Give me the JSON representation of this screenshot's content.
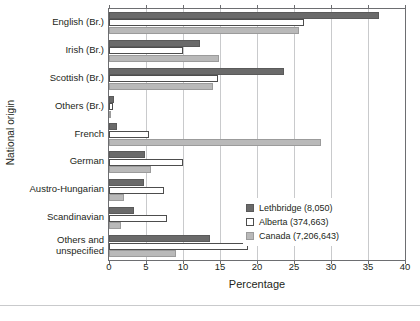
{
  "chart_data": {
    "type": "bar",
    "orientation": "horizontal",
    "title": "",
    "xlabel": "Percentage",
    "ylabel": "National origin",
    "xlim": [
      0,
      40
    ],
    "xticks": [
      0,
      5,
      10,
      15,
      20,
      25,
      30,
      35,
      40
    ],
    "grid": true,
    "legend_position": "center-right",
    "categories": [
      "English (Br.)",
      "Irish (Br.)",
      "Scottish (Br.)",
      "Others (Br.)",
      "French",
      "German",
      "Austro-Hungarian",
      "Scandinavian",
      "Others and\nunspecified"
    ],
    "series": [
      {
        "name": "Lethbridge (8,050)",
        "color": "#6a6a6a",
        "values": [
          36.5,
          12.3,
          23.6,
          0.7,
          1.1,
          4.9,
          4.7,
          3.4,
          13.7
        ]
      },
      {
        "name": "Alberta (374,663)",
        "color": "#ffffff",
        "values": [
          26.3,
          10.0,
          14.7,
          0.5,
          5.4,
          10.0,
          7.4,
          7.8,
          18.8
        ]
      },
      {
        "name": "Canada (7,206,643)",
        "color": "#b9b9b9",
        "values": [
          25.7,
          14.9,
          14.0,
          0.3,
          28.6,
          5.7,
          2.0,
          1.6,
          9.1
        ]
      }
    ]
  },
  "legend": {
    "items": [
      {
        "label": "Lethbridge (8,050)"
      },
      {
        "label": "Alberta (374,663)"
      },
      {
        "label": "Canada (7,206,643)"
      }
    ]
  },
  "axes": {
    "x_title": "Percentage",
    "y_title": "National origin",
    "x_tick_labels": [
      "0",
      "5",
      "10",
      "15",
      "20",
      "25",
      "30",
      "35",
      "40"
    ]
  }
}
